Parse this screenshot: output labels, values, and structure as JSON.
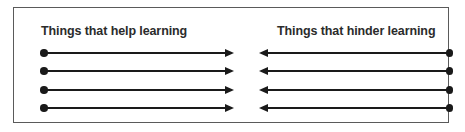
{
  "diagram": {
    "type": "force-field-analysis",
    "frame": {
      "border_color": "#5a5a5a",
      "background_color": "#ffffff"
    },
    "columns": [
      {
        "id": "help",
        "heading": "Things that help learning",
        "direction": "right",
        "arrow_count": 4,
        "dot_end": "left",
        "arrowhead_end": "right"
      },
      {
        "id": "hinder",
        "heading": "Things that hinder learning",
        "direction": "left",
        "arrow_count": 4,
        "dot_end": "right",
        "arrowhead_end": "left"
      }
    ],
    "arrow_color": "#1a1a1a",
    "heading_color": "#2b2b2b",
    "rows": [
      {
        "index": 1
      },
      {
        "index": 2
      },
      {
        "index": 3
      },
      {
        "index": 4
      }
    ]
  }
}
